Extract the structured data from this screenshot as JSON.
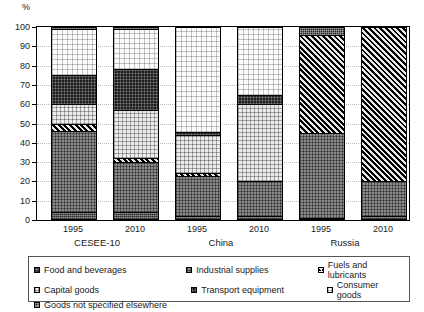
{
  "axis": {
    "y_unit_label": "%",
    "y_ticks": [
      "100",
      "90",
      "80",
      "70",
      "60",
      "50",
      "40",
      "30",
      "20",
      "10",
      "0"
    ]
  },
  "groups": [
    {
      "name": "CESEE-10",
      "years": [
        "1995",
        "2010"
      ]
    },
    {
      "name": "China",
      "years": [
        "1995",
        "2010"
      ]
    },
    {
      "name": "Russia",
      "years": [
        "1995",
        "2010"
      ]
    }
  ],
  "legend": {
    "items": [
      {
        "label": "Food and beverages",
        "key": "food",
        "swatch": "p-food"
      },
      {
        "label": "Industrial supplies",
        "key": "industrial_supplies",
        "swatch": "p-indus"
      },
      {
        "label": "Fuels and lubricants",
        "key": "fuels",
        "swatch": "p-fuel"
      },
      {
        "label": "Capital goods",
        "key": "capital_goods",
        "swatch": "p-capital"
      },
      {
        "label": "Transport equipment",
        "key": "transport_equipment",
        "swatch": "p-transport"
      },
      {
        "label": "Consumer goods",
        "key": "consumer_goods",
        "swatch": "p-consumer"
      },
      {
        "label": "Goods not specified elsewhere",
        "key": "other",
        "swatch": "p-other"
      }
    ]
  },
  "chart_data": {
    "type": "bar",
    "subtype": "stacked-100-percent",
    "title": "",
    "xlabel": "",
    "ylabel": "%",
    "ylim": [
      0,
      100
    ],
    "ytick_step": 10,
    "grid": true,
    "legend_position": "bottom",
    "categories": [
      "CESEE-10 1995",
      "CESEE-10 2010",
      "China 1995",
      "China 2010",
      "Russia 1995",
      "Russia 2010"
    ],
    "series": [
      {
        "name": "Food and beverages",
        "values": [
          4,
          4,
          2,
          2,
          1,
          2
        ]
      },
      {
        "name": "Industrial supplies",
        "values": [
          42,
          26,
          21,
          18,
          44,
          18
        ]
      },
      {
        "name": "Fuels and lubricants",
        "values": [
          4,
          2,
          1.5,
          0,
          51,
          80
        ]
      },
      {
        "name": "Capital goods",
        "values": [
          10,
          25,
          19.5,
          40,
          0,
          0
        ]
      },
      {
        "name": "Transport equipment",
        "values": [
          15,
          21,
          1.5,
          5,
          0,
          0
        ]
      },
      {
        "name": "Consumer goods",
        "values": [
          24,
          21,
          54.5,
          35,
          0,
          0
        ]
      },
      {
        "name": "Goods not specified elsewhere",
        "values": [
          1,
          1,
          0,
          0,
          4,
          0
        ]
      }
    ]
  }
}
